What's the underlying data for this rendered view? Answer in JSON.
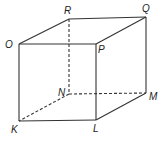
{
  "diagram": {
    "type": "cube",
    "stroke_color": "#333333",
    "vertices": {
      "O": {
        "x": 19,
        "y": 44,
        "label": "O",
        "lx": 6,
        "ly": 48
      },
      "P": {
        "x": 96,
        "y": 44,
        "label": "P",
        "lx": 98,
        "ly": 53
      },
      "Q": {
        "x": 146,
        "y": 17,
        "label": "Q",
        "lx": 144,
        "ly": 12
      },
      "R": {
        "x": 69,
        "y": 19,
        "label": "R",
        "lx": 64,
        "ly": 14
      },
      "K": {
        "x": 19,
        "y": 121,
        "label": "K",
        "lx": 11,
        "ly": 133
      },
      "L": {
        "x": 96,
        "y": 120,
        "label": "L",
        "lx": 93,
        "ly": 132
      },
      "M": {
        "x": 146,
        "y": 93,
        "label": "M",
        "lx": 149,
        "ly": 100
      },
      "N": {
        "x": 69,
        "y": 94,
        "label": "N",
        "lx": 58,
        "ly": 95
      }
    },
    "solid_edges": [
      "OP",
      "PQ",
      "QR",
      "RO",
      "OK",
      "KL",
      "LP",
      "LM",
      "MQ"
    ],
    "dashed_edges": [
      "RN",
      "NM",
      "NK"
    ]
  }
}
